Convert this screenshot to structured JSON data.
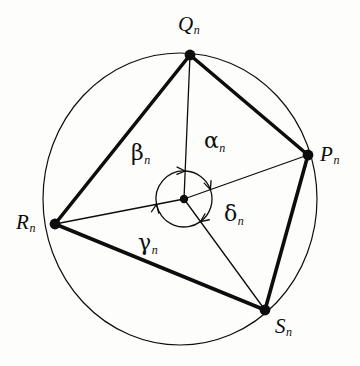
{
  "figure": {
    "kind": "geometry-diagram",
    "background_color": "#fdfdfc",
    "ink_color": "#0d0d0d"
  },
  "circle": {
    "name": "circumscribed-circle",
    "cx": 180,
    "cy": 199,
    "rx": 137,
    "ry": 146,
    "stroke_width": 1.2
  },
  "center_point": {
    "name": "center",
    "x": 184,
    "y": 199,
    "dot_radius": 4.2
  },
  "vertices": [
    {
      "id": "Q",
      "base": "Q",
      "sub": "n",
      "x": 190,
      "y": 55,
      "label_x": 178,
      "label_y": 14,
      "dot_radius": 5.4
    },
    {
      "id": "P",
      "base": "P",
      "sub": "n",
      "x": 308,
      "y": 155,
      "label_x": 320,
      "label_y": 144,
      "dot_radius": 5.4
    },
    {
      "id": "R",
      "base": "R",
      "sub": "n",
      "x": 55,
      "y": 224,
      "label_x": 16,
      "label_y": 212,
      "dot_radius": 5.4
    },
    {
      "id": "S",
      "base": "S",
      "sub": "n",
      "x": 265,
      "y": 310,
      "label_x": 275,
      "label_y": 316,
      "dot_radius": 5.4
    }
  ],
  "quadrilateral": {
    "name": "inscribed-quadrilateral",
    "stroke_width": 3.6,
    "edges": [
      {
        "from": "Q",
        "to": "P",
        "x1": 190,
        "y1": 55,
        "x2": 308,
        "y2": 155
      },
      {
        "from": "P",
        "to": "S",
        "x1": 308,
        "y1": 155,
        "x2": 265,
        "y2": 310
      },
      {
        "from": "S",
        "to": "R",
        "x1": 265,
        "y1": 310,
        "x2": 55,
        "y2": 224
      },
      {
        "from": "R",
        "to": "Q",
        "x1": 55,
        "y1": 224,
        "x2": 190,
        "y2": 55
      }
    ]
  },
  "radii": {
    "name": "center-radii",
    "stroke_width": 1.3,
    "lines": [
      {
        "to": "Q",
        "x1": 184,
        "y1": 199,
        "x2": 190,
        "y2": 55
      },
      {
        "to": "P",
        "x1": 184,
        "y1": 199,
        "x2": 308,
        "y2": 155
      },
      {
        "to": "R",
        "x1": 184,
        "y1": 199,
        "x2": 55,
        "y2": 224
      },
      {
        "to": "S",
        "x1": 184,
        "y1": 199,
        "x2": 265,
        "y2": 310
      }
    ]
  },
  "angle_arcs": {
    "name": "central-angle-arcs",
    "radius": 28,
    "stroke_width": 1.3,
    "arcs": [
      {
        "id": "alpha",
        "between": "O-P to O-Q",
        "start_deg": -19.5,
        "end_deg": -87.6,
        "sweep": "counterclockwise",
        "arrow_at": "end",
        "d": "M 210.4 189.6 A 28 28 0 0 0 185.2 171.0",
        "arrow_tip_x": 185.2,
        "arrow_tip_y": 171.0,
        "arrow_angle_deg": 182
      },
      {
        "id": "beta",
        "between": "O-Q to O-R",
        "start_deg": -87.6,
        "end_deg": 169.0,
        "sweep": "counterclockwise",
        "arrow_at": "end",
        "d": "M 185.2 171.0 A 28 28 0 0 0 156.5 204.3",
        "arrow_tip_x": 156.5,
        "arrow_tip_y": 204.3,
        "arrow_angle_deg": 100
      },
      {
        "id": "gamma",
        "between": "O-R to O-S",
        "start_deg": 169.0,
        "end_deg": 53.8,
        "sweep": "counterclockwise",
        "arrow_at": "end",
        "d": "M 156.5 204.3 A 28 28 0 0 0 200.5 221.6",
        "arrow_tip_x": 200.5,
        "arrow_tip_y": 221.6,
        "arrow_angle_deg": -36
      },
      {
        "id": "delta",
        "between": "O-S to O-P",
        "start_deg": 53.8,
        "end_deg": -19.5,
        "sweep": "counterclockwise",
        "arrow_at": "end",
        "d": "M 200.5 221.6 A 28 28 0 0 0 210.4 189.6",
        "arrow_tip_x": 210.4,
        "arrow_tip_y": 189.6,
        "arrow_angle_deg": -110
      }
    ]
  },
  "angle_labels": [
    {
      "id": "alpha",
      "base": "α",
      "sub": "n",
      "label_x": 204,
      "label_y": 130
    },
    {
      "id": "beta",
      "base": "β",
      "sub": "n",
      "label_x": 131,
      "label_y": 142
    },
    {
      "id": "gamma",
      "base": "γ",
      "sub": "n",
      "label_x": 138,
      "label_y": 232
    },
    {
      "id": "delta",
      "base": "δ",
      "sub": "n",
      "label_x": 224,
      "label_y": 203
    }
  ]
}
